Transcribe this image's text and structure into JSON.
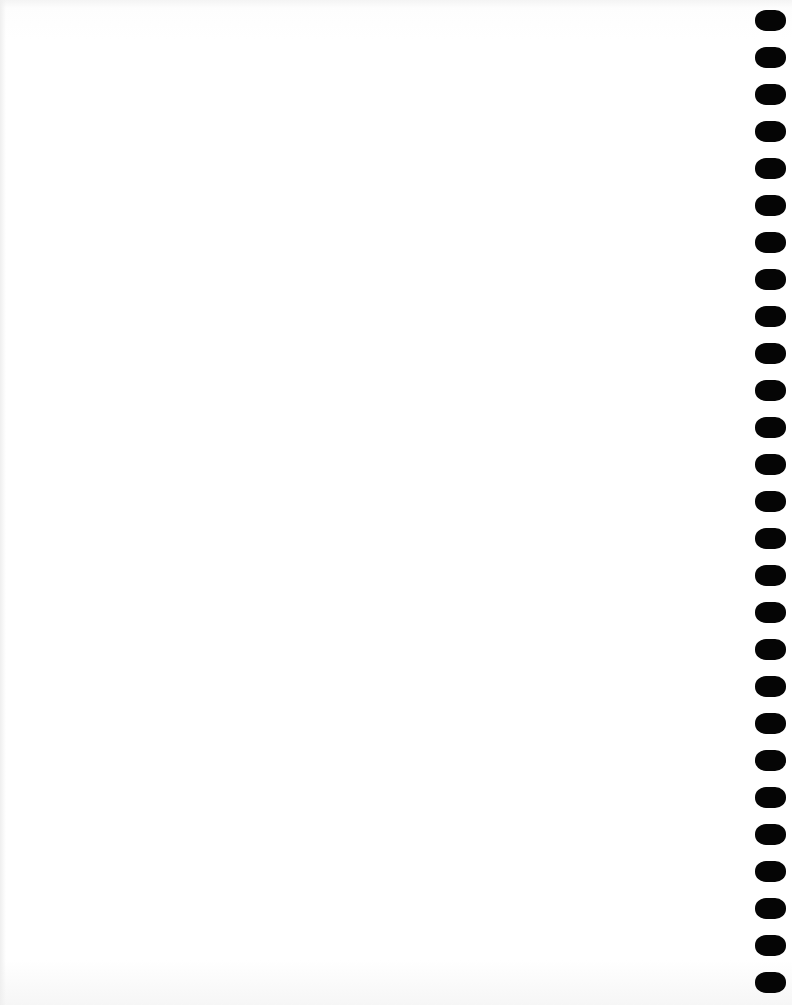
{
  "page": {
    "type": "blank-notebook-page",
    "background_color": "#ffffff",
    "hole_color": "#050505",
    "hole_count": 27
  },
  "holes": [
    20,
    57,
    94,
    131,
    168,
    205,
    242,
    279,
    316,
    353,
    390,
    427,
    464,
    501,
    538,
    575,
    612,
    649,
    686,
    723,
    760,
    797,
    834,
    871,
    908,
    945,
    982
  ]
}
